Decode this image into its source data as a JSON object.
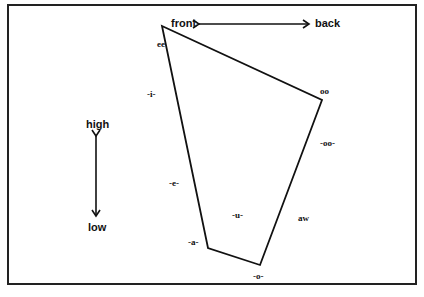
{
  "diagram": {
    "type": "vowel-quadrilateral",
    "axes": {
      "horizontal": {
        "left": "front",
        "right": "back"
      },
      "vertical": {
        "top": "high",
        "bottom": "low"
      }
    },
    "vertices": [
      {
        "label": "ee",
        "x": 162,
        "y": 26
      },
      {
        "label": "oo",
        "x": 322,
        "y": 100
      },
      {
        "label": "-o-",
        "x": 260,
        "y": 265
      },
      {
        "label": "-a-",
        "x": 208,
        "y": 248
      }
    ],
    "inner_labels": {
      "i": "-i-",
      "e": "-e-",
      "u": "-u-",
      "oo_short": "-oo-",
      "aw": "aw"
    },
    "colors": {
      "line": "#111111",
      "background": "#ffffff",
      "border": "#222222"
    }
  }
}
